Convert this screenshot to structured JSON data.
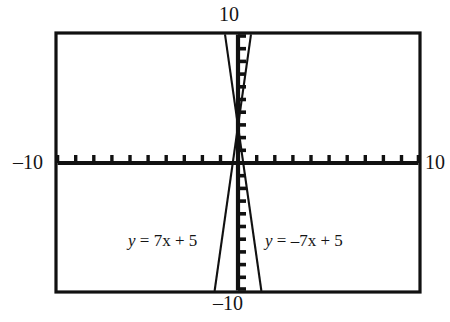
{
  "figure": {
    "title": "",
    "type": "graphing-calculator-plot",
    "frame": {
      "x_left_px": 56,
      "y_top_px": 33,
      "x_right_px": 420,
      "y_bottom_px": 292,
      "border_color": "#111111"
    },
    "axes": {
      "x_axis_y_px": 163,
      "y_axis_x_px": 238,
      "x_label_min": "–10",
      "x_label_max": "10",
      "y_label_max": "10",
      "y_label_min": "–10",
      "tick_count_x": 20,
      "tick_count_y": 20,
      "tick_color": "#111111"
    },
    "labels": {
      "left_equation": "y = 7x + 5",
      "right_equation": "y = –7x + 5"
    }
  },
  "chart_data": {
    "type": "line",
    "title": "",
    "xlabel": "",
    "ylabel": "",
    "xlim": [
      -10,
      10
    ],
    "ylim": [
      -10,
      10
    ],
    "grid": false,
    "legend": "inline-annotations",
    "xticks": [
      -10,
      -9,
      -8,
      -7,
      -6,
      -5,
      -4,
      -3,
      -2,
      -1,
      0,
      1,
      2,
      3,
      4,
      5,
      6,
      7,
      8,
      9,
      10
    ],
    "yticks": [
      -10,
      -9,
      -8,
      -7,
      -6,
      -5,
      -4,
      -3,
      -2,
      -1,
      0,
      1,
      2,
      3,
      4,
      5,
      6,
      7,
      8,
      9,
      10
    ],
    "xtick_labels": [
      "–10",
      "10"
    ],
    "ytick_labels": [
      "–10",
      "10"
    ],
    "series": [
      {
        "name": "y = 7x + 5",
        "equation": "y = 7x + 5",
        "slope": 7,
        "intercept": 5,
        "x": [
          -2.142857,
          0.714286
        ],
        "y": [
          -10,
          10
        ],
        "color": "#111111"
      },
      {
        "name": "y = -7x + 5",
        "equation": "y = –7x + 5",
        "slope": -7,
        "intercept": 5,
        "x": [
          -0.714286,
          2.142857
        ],
        "y": [
          10,
          -10
        ],
        "color": "#111111"
      }
    ],
    "annotations": [
      {
        "text": "y = 7x + 5",
        "x": -4.3,
        "y": -5.0
      },
      {
        "text": "y = –7x + 5",
        "x": 1.5,
        "y": -5.0
      },
      {
        "text": "10",
        "x": 0,
        "y": 11.6
      },
      {
        "text": "–10",
        "x": 0,
        "y": -11.6
      },
      {
        "text": "–10",
        "x": -12.3,
        "y": 0
      },
      {
        "text": "10",
        "x": 12.3,
        "y": 0
      }
    ]
  }
}
